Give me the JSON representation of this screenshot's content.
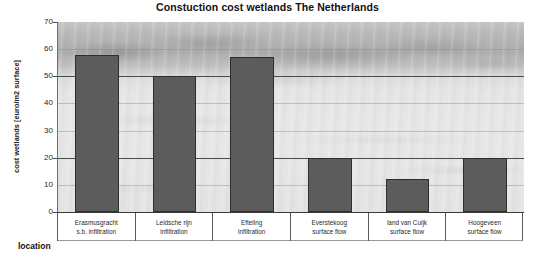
{
  "chart_data": {
    "type": "bar",
    "title": "Constuction cost wetlands The Netherlands",
    "xlabel": "location",
    "ylabel": "cost wetlands [euro/m2 surface]",
    "ylim": [
      0,
      70
    ],
    "yticks": [
      0,
      10,
      20,
      30,
      40,
      50,
      60,
      70
    ],
    "grid": true,
    "legend": "none",
    "categories": [
      "Erasmusgracht s.b. infiltration",
      "Leidsche rijn infiltration",
      "Efteling infiltration",
      "Everstekoog surface flow",
      "land van Cuijk surface flow",
      "Hoogeveen surface flow"
    ],
    "category_lines": [
      [
        "Erasmusgracht",
        "s.b. infiltration"
      ],
      [
        "Leidsche rijn",
        "infiltration"
      ],
      [
        "Efteling",
        "infiltration"
      ],
      [
        "Everstekoog",
        "surface flow"
      ],
      [
        "land van Cuijk",
        "surface flow"
      ],
      [
        "Hoogeveen",
        "surface flow"
      ]
    ],
    "values": [
      58,
      50,
      57,
      20,
      12,
      20
    ],
    "bar_color": "#5c5c5c",
    "bar_edge_color": "#2e2e2e",
    "gridline_color": "#4a4a4a",
    "background_note": "faded grayscale photograph of a wetland behind plot area"
  }
}
